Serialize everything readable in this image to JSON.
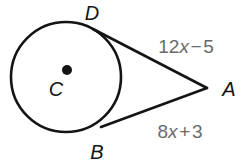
{
  "figure": {
    "type": "geometry-diagram",
    "background_color": "#ffffff",
    "stroke_color": "#141414",
    "label_color": "#141414",
    "expression_color": "#6b6b6b",
    "circle": {
      "center_label": "C",
      "center_x": 66,
      "center_y": 77,
      "radius": 55,
      "stroke_width": 2.6
    },
    "center_dot": {
      "x": 67,
      "y": 70,
      "radius": 5
    },
    "points": [
      {
        "name": "D",
        "label": "D",
        "x": 93,
        "y": 29,
        "label_x": 92,
        "label_y": 13
      },
      {
        "name": "A",
        "label": "A",
        "x": 207,
        "y": 88,
        "label_x": 229,
        "label_y": 89
      },
      {
        "name": "B",
        "label": "B",
        "x": 101,
        "y": 127,
        "label_x": 97,
        "label_y": 152
      },
      {
        "name": "C",
        "label": "C",
        "x": 66,
        "y": 77,
        "label_x": 56,
        "label_y": 89
      }
    ],
    "segments": [
      {
        "name": "tangent-DA",
        "from": "D",
        "to": "A",
        "x1": 93,
        "y1": 29,
        "x2": 207,
        "y2": 88,
        "measure": "12x - 5"
      },
      {
        "name": "tangent-BA",
        "from": "B",
        "to": "A",
        "x1": 101,
        "y1": 127,
        "x2": 207,
        "y2": 88,
        "measure": "8x + 3"
      }
    ],
    "expressions": [
      {
        "name": "tangent-DA-length",
        "text": "12x − 5",
        "coefficient": "12",
        "variable": "x",
        "operator": "−",
        "constant": "5",
        "x": 186,
        "y": 46
      },
      {
        "name": "tangent-BA-length",
        "text": "8x + 3",
        "coefficient": "8",
        "variable": "x",
        "operator": "+",
        "constant": "3",
        "x": 180,
        "y": 131
      }
    ]
  }
}
